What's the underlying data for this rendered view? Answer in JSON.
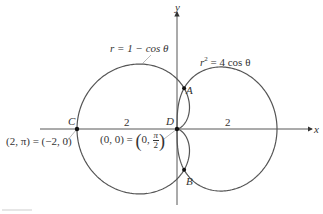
{
  "labels": {
    "cardioid_eq": "r = 1 − cos θ",
    "lemniscate_eq_left": "r",
    "lemniscate_eq_sup": "2",
    "lemniscate_eq_right": " = 4 cos θ",
    "y_axis": "y",
    "x_axis": "x",
    "point_A": "A",
    "point_B": "B",
    "point_C": "C",
    "point_D": "D",
    "dist_left": "2",
    "dist_right": "2",
    "c_coords": "(2, π) = (−2, 0)",
    "d_coords_prefix": "(0, 0) = ",
    "d_coords_inner": "0, ",
    "d_frac_num": "π",
    "d_frac_den": "2"
  },
  "chart_data": {
    "type": "diagram",
    "title": "",
    "curves": [
      {
        "name": "r = 1 − cos θ",
        "kind": "polar",
        "equation": "r = 1 - cos(theta)"
      },
      {
        "name": "r^2 = 4 cos θ",
        "kind": "polar",
        "equation": "r^2 = 4 cos(theta)"
      }
    ],
    "points": [
      {
        "label": "A",
        "description": "intersection, upper"
      },
      {
        "label": "B",
        "description": "intersection, lower"
      },
      {
        "label": "C",
        "x": -2,
        "y": 0,
        "polar": "(2, π)"
      },
      {
        "label": "D",
        "x": 0,
        "y": 0,
        "polar": "(0, π/2)"
      }
    ],
    "annotations": [
      "2",
      "2"
    ],
    "xlabel": "x",
    "ylabel": "y",
    "scale_px_per_unit": 50,
    "origin_px": [
      177,
      129
    ],
    "colors": {
      "curve": "#555555",
      "axis": "#444444",
      "point": "#111111"
    }
  }
}
